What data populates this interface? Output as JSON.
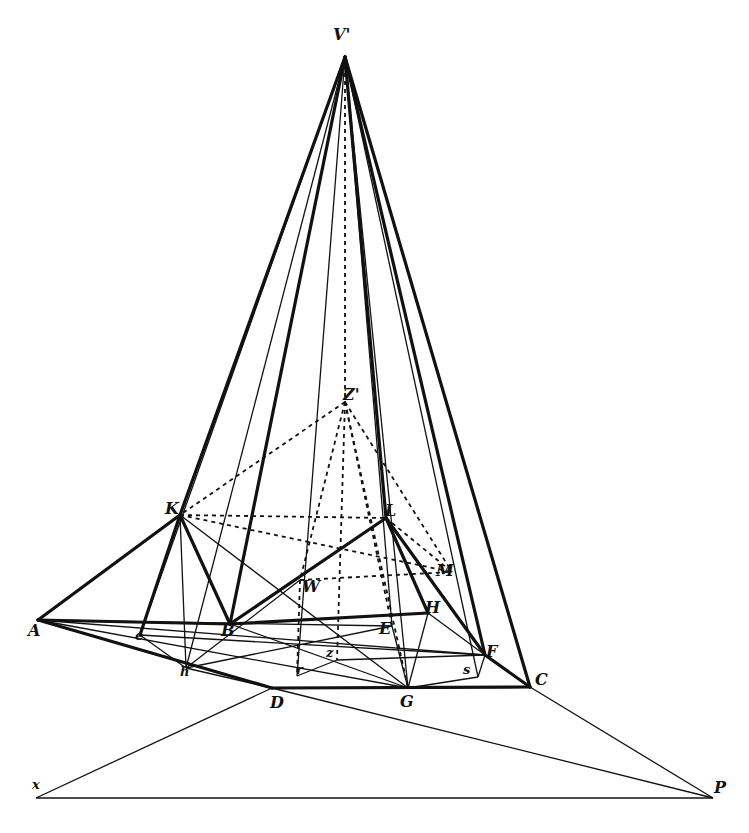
{
  "diagram": {
    "type": "geometric-perspective-construction",
    "ink_color": "#111111",
    "background": "#ffffff",
    "points": {
      "V": {
        "x": 345,
        "y": 57,
        "label": "V'",
        "lx": 333,
        "ly": 40
      },
      "Z": {
        "x": 345,
        "y": 402,
        "label": "Z'",
        "lx": 343,
        "ly": 400
      },
      "K": {
        "x": 180,
        "y": 515,
        "label": "K",
        "lx": 165,
        "ly": 514
      },
      "L": {
        "x": 386,
        "y": 518,
        "label": "L",
        "lx": 385,
        "ly": 516
      },
      "A": {
        "x": 38,
        "y": 620,
        "label": "A",
        "lx": 28,
        "ly": 636
      },
      "B": {
        "x": 230,
        "y": 624,
        "label": "B",
        "lx": 221,
        "ly": 636
      },
      "E": {
        "x": 392,
        "y": 626,
        "label": "E",
        "lx": 379,
        "ly": 634
      },
      "e": {
        "x": 140,
        "y": 635,
        "label": "e",
        "lx": 135,
        "ly": 640
      },
      "H": {
        "x": 428,
        "y": 613,
        "label": "H",
        "lx": 425,
        "ly": 613
      },
      "h": {
        "x": 186,
        "y": 668,
        "label": "h",
        "lx": 180,
        "ly": 676
      },
      "W": {
        "x": 300,
        "y": 580,
        "label": "W",
        "lx": 302,
        "ly": 592
      },
      "M": {
        "x": 452,
        "y": 572,
        "label": "M",
        "lx": 436,
        "ly": 576
      },
      "D": {
        "x": 272,
        "y": 688,
        "label": "D",
        "lx": 270,
        "ly": 708
      },
      "G": {
        "x": 408,
        "y": 688,
        "label": "G",
        "lx": 400,
        "ly": 707
      },
      "C": {
        "x": 530,
        "y": 687,
        "label": "C",
        "lx": 535,
        "ly": 685
      },
      "F": {
        "x": 485,
        "y": 655,
        "label": "F",
        "lx": 486,
        "ly": 657
      },
      "r": {
        "x": 297,
        "y": 676,
        "label": "r",
        "lx": 296,
        "ly": 674
      },
      "z": {
        "x": 337,
        "y": 660,
        "label": "z",
        "lx": 326,
        "ly": 657
      },
      "s": {
        "x": 478,
        "y": 677,
        "label": "s",
        "lx": 463,
        "ly": 674
      },
      "x": {
        "x": 36,
        "y": 798,
        "label": "x",
        "lx": 32,
        "ly": 789
      },
      "P": {
        "x": 713,
        "y": 798,
        "label": "P",
        "lx": 714,
        "ly": 793
      }
    },
    "thick_lines": [
      [
        "V",
        "K"
      ],
      [
        "V",
        "B"
      ],
      [
        "V",
        "L"
      ],
      [
        "V",
        "F"
      ],
      [
        "V",
        "C"
      ],
      [
        "K",
        "A"
      ],
      [
        "K",
        "B"
      ],
      [
        "L",
        "B"
      ],
      [
        "L",
        "H"
      ],
      [
        "L",
        "F"
      ],
      [
        "A",
        "B"
      ],
      [
        "B",
        "H"
      ],
      [
        "A",
        "D"
      ],
      [
        "D",
        "C"
      ],
      [
        "e",
        "K"
      ],
      [
        "F",
        "C"
      ]
    ],
    "thin_lines": [
      [
        "V",
        "h"
      ],
      [
        "V",
        "e"
      ],
      [
        "V",
        "G"
      ],
      [
        "V",
        "E"
      ],
      [
        "V",
        "s"
      ],
      [
        "V",
        "r"
      ],
      [
        "A",
        "E"
      ],
      [
        "A",
        "F"
      ],
      [
        "e",
        "F"
      ],
      [
        "e",
        "h"
      ],
      [
        "h",
        "E"
      ],
      [
        "h",
        "D"
      ],
      [
        "h",
        "W"
      ],
      [
        "K",
        "h"
      ],
      [
        "K",
        "G"
      ],
      [
        "B",
        "G"
      ],
      [
        "E",
        "G"
      ],
      [
        "G",
        "H"
      ],
      [
        "G",
        "C"
      ],
      [
        "H",
        "F"
      ],
      [
        "F",
        "s"
      ],
      [
        "s",
        "G"
      ],
      [
        "r",
        "z"
      ],
      [
        "D",
        "G"
      ],
      [
        "x",
        "P"
      ],
      [
        "D",
        "x"
      ],
      [
        "D",
        "P"
      ],
      [
        "C",
        "P"
      ],
      [
        "A",
        "G"
      ],
      [
        "z",
        "F"
      ]
    ],
    "dashed_lines": [
      [
        "V",
        "Z"
      ],
      [
        "Z",
        "K"
      ],
      [
        "Z",
        "M"
      ],
      [
        "Z",
        "W"
      ],
      [
        "Z",
        "z"
      ],
      [
        "Z",
        "G"
      ],
      [
        "K",
        "L"
      ],
      [
        "K",
        "M"
      ],
      [
        "L",
        "M"
      ],
      [
        "W",
        "M"
      ],
      [
        "W",
        "r"
      ],
      [
        "Z",
        "E"
      ]
    ]
  }
}
